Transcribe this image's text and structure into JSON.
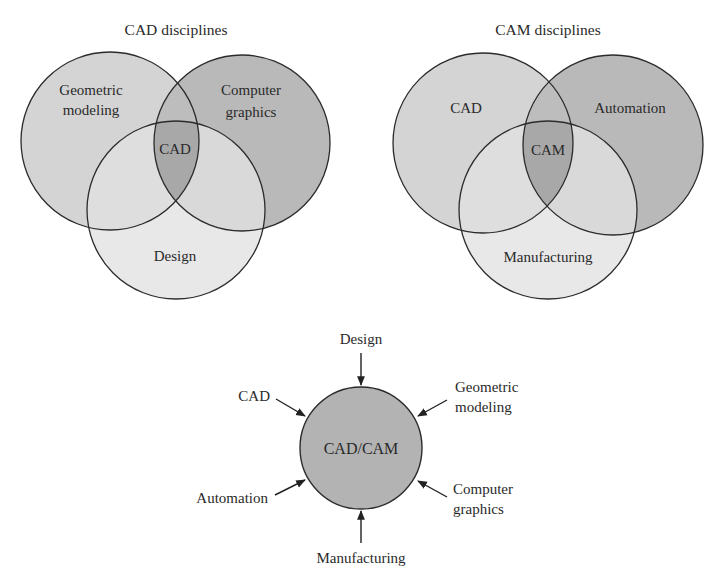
{
  "colors": {
    "background": "#ffffff",
    "circle_light": "#d4d4d4",
    "circle_mid": "#b9b9b9",
    "circle_bottom": "#e8e8e8",
    "pair_overlap": "#c2c2c2",
    "center_overlap": "#a8a8a8",
    "hub_fill": "#b3b3b3",
    "stroke": "#2b2b2b",
    "text": "#2a2a2a"
  },
  "cad_venn": {
    "title": "CAD disciplines",
    "sets": [
      {
        "name": "geometric-modeling",
        "line1": "Geometric",
        "line2": "modeling"
      },
      {
        "name": "computer-graphics",
        "line1": "Computer",
        "line2": "graphics"
      },
      {
        "name": "design",
        "line1": "Design"
      }
    ],
    "intersection": "CAD"
  },
  "cam_venn": {
    "title": "CAM disciplines",
    "sets": [
      {
        "name": "cad",
        "line1": "CAD"
      },
      {
        "name": "automation",
        "line1": "Automation"
      },
      {
        "name": "manufacturing",
        "line1": "Manufacturing"
      }
    ],
    "intersection": "CAM"
  },
  "hub": {
    "center": "CAD/CAM",
    "inputs": {
      "top": {
        "line1": "Design"
      },
      "upper_left": {
        "line1": "CAD"
      },
      "upper_right": {
        "line1": "Geometric",
        "line2": "modeling"
      },
      "lower_left": {
        "line1": "Automation"
      },
      "lower_right": {
        "line1": "Computer",
        "line2": "graphics"
      },
      "bottom": {
        "line1": "Manufacturing"
      }
    }
  }
}
